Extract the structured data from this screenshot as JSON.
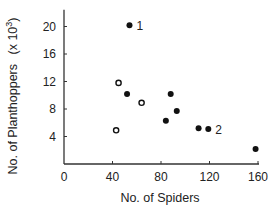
{
  "chart_data": {
    "type": "scatter",
    "title": "",
    "xlabel": "No. of Spiders",
    "ylabel": "No. of Planthoppers",
    "ylabel_unit": "(x 10",
    "ylabel_unit_sup": "3",
    "ylabel_unit_close": ")",
    "xlim": [
      0,
      160
    ],
    "ylim": [
      0,
      22
    ],
    "xticks": [
      0,
      40,
      80,
      120,
      160
    ],
    "yticks": [
      4,
      8,
      12,
      16,
      20
    ],
    "grid": false,
    "legend": "none",
    "series": [
      {
        "name": "filled",
        "marker": "filled-circle",
        "points": [
          {
            "x": 54,
            "y": 20.2,
            "label": "1"
          },
          {
            "x": 52,
            "y": 10.2
          },
          {
            "x": 88,
            "y": 10.2
          },
          {
            "x": 93,
            "y": 7.7
          },
          {
            "x": 84,
            "y": 6.3
          },
          {
            "x": 111,
            "y": 5.2
          },
          {
            "x": 119,
            "y": 5.1,
            "label": "2"
          },
          {
            "x": 158,
            "y": 2.2
          }
        ]
      },
      {
        "name": "open",
        "marker": "open-circle",
        "points": [
          {
            "x": 45,
            "y": 11.8
          },
          {
            "x": 64,
            "y": 8.9
          },
          {
            "x": 43,
            "y": 4.9
          }
        ]
      }
    ]
  }
}
